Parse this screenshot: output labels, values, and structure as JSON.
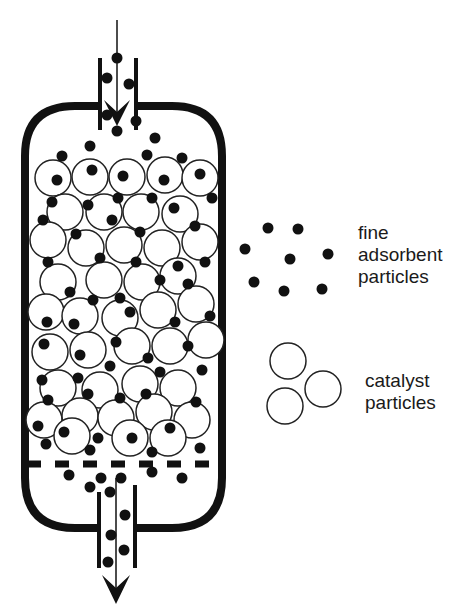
{
  "diagram": {
    "type": "fixed-bed reactor schematic",
    "colors": {
      "ink": "#111111",
      "background": "#ffffff"
    },
    "vessel": {
      "x": 25,
      "y": 103,
      "width": 197,
      "height": 425,
      "corner_radius": 50,
      "stroke": 8
    },
    "inlet": {
      "label": "",
      "flow": "downward"
    },
    "outlet": {
      "label": "",
      "flow": "downward"
    },
    "support_grid": {
      "style": "dashed",
      "y": 463
    }
  },
  "legend": {
    "fine": {
      "lines": [
        "fine",
        "adsorbent",
        "particles"
      ]
    },
    "catalyst": {
      "lines": [
        "catalyst",
        "particles"
      ]
    }
  }
}
